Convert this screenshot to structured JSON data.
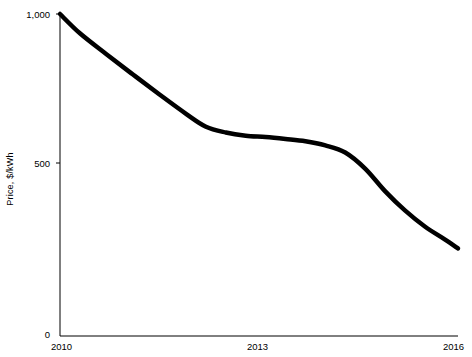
{
  "chart_data": {
    "type": "line",
    "title": "",
    "xlabel": "",
    "ylabel": "Price, $/kWh",
    "xlim": [
      2010,
      2016
    ],
    "ylim": [
      0,
      1000
    ],
    "xticks": [
      "2010",
      "2013",
      "2016"
    ],
    "xtick_values": [
      2010,
      2013,
      2016
    ],
    "yticks": [
      "0",
      "500",
      "1,000"
    ],
    "ytick_values": [
      0,
      500,
      1000
    ],
    "grid": false,
    "legend": false,
    "series": [
      {
        "name": "Battery pack price",
        "x": [
          2010,
          2010.3,
          2010.7,
          2011.1,
          2011.5,
          2011.9,
          2012.2,
          2012.5,
          2012.8,
          2013.1,
          2013.4,
          2013.7,
          2014.0,
          2014.3,
          2014.6,
          2014.9,
          2015.2,
          2015.5,
          2015.8,
          2016
        ],
        "values": [
          1000,
          940,
          875,
          812,
          750,
          690,
          650,
          632,
          622,
          618,
          612,
          605,
          592,
          570,
          520,
          450,
          390,
          340,
          300,
          272
        ]
      }
    ]
  },
  "axis": {
    "y_axis_title": "Price, $/kWh"
  }
}
